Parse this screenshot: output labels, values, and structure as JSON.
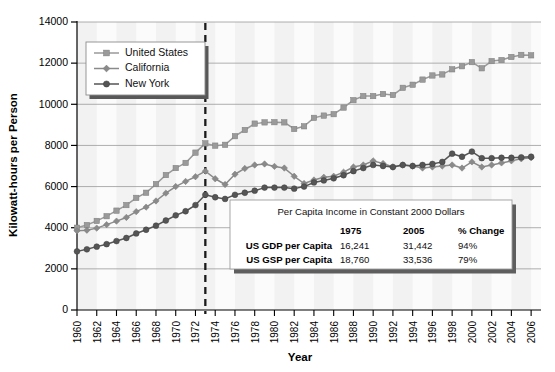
{
  "chart_data": {
    "type": "line",
    "title": "",
    "xlabel": "Year",
    "ylabel": "Kilowatt-hours per Person",
    "xlim": [
      1960,
      2007
    ],
    "ylim": [
      0,
      14000
    ],
    "grid": true,
    "legend_position": "top-left",
    "ytick_labels": [
      "0",
      "2000",
      "4000",
      "6000",
      "8000",
      "10000",
      "12000",
      "14000"
    ],
    "ytick_values": [
      0,
      2000,
      4000,
      6000,
      8000,
      10000,
      12000,
      14000
    ],
    "xtick_labels": [
      "1960",
      "1962",
      "1964",
      "1966",
      "1968",
      "1970",
      "1972",
      "1974",
      "1976",
      "1978",
      "1980",
      "1982",
      "1984",
      "1986",
      "1988",
      "1990",
      "1992",
      "1994",
      "1996",
      "1998",
      "2000",
      "2002",
      "2004",
      "2006"
    ],
    "xtick_values": [
      1960,
      1962,
      1964,
      1966,
      1968,
      1970,
      1972,
      1974,
      1976,
      1978,
      1980,
      1982,
      1984,
      1986,
      1988,
      1990,
      1992,
      1994,
      1996,
      1998,
      2000,
      2002,
      2004,
      2006
    ],
    "annotations": [
      {
        "type": "vertical-dashed-line",
        "x": 1973,
        "label": "1973"
      }
    ],
    "x": [
      1960,
      1961,
      1962,
      1963,
      1964,
      1965,
      1966,
      1967,
      1968,
      1969,
      1970,
      1971,
      1972,
      1973,
      1974,
      1975,
      1976,
      1977,
      1978,
      1979,
      1980,
      1981,
      1982,
      1983,
      1984,
      1985,
      1986,
      1987,
      1988,
      1989,
      1990,
      1991,
      1992,
      1993,
      1994,
      1995,
      1996,
      1997,
      1998,
      1999,
      2000,
      2001,
      2002,
      2003,
      2004,
      2005,
      2006
    ],
    "series": [
      {
        "name": "United States",
        "marker": "square",
        "color": "#9a9a9a",
        "values": [
          4000,
          4130,
          4330,
          4560,
          4830,
          5100,
          5450,
          5700,
          6120,
          6560,
          6900,
          7150,
          7650,
          8100,
          7990,
          8030,
          8450,
          8750,
          9060,
          9120,
          9130,
          9120,
          8800,
          8930,
          9340,
          9450,
          9520,
          9840,
          10200,
          10400,
          10400,
          10500,
          10450,
          10800,
          10950,
          11200,
          11400,
          11450,
          11700,
          11850,
          12050,
          11750,
          12100,
          12150,
          12300,
          12400,
          12380
        ]
      },
      {
        "name": "California",
        "marker": "diamond",
        "color": "#8a8a8a",
        "values": [
          3850,
          3880,
          3980,
          4150,
          4320,
          4500,
          4780,
          5000,
          5300,
          5680,
          6000,
          6250,
          6480,
          6750,
          6380,
          6100,
          6600,
          6880,
          7050,
          7100,
          6980,
          6900,
          6500,
          6150,
          6320,
          6450,
          6500,
          6700,
          6950,
          7050,
          7250,
          7120,
          6950,
          7050,
          7000,
          6900,
          6950,
          7000,
          7050,
          6900,
          7200,
          6950,
          7050,
          7150,
          7250,
          7350,
          7400
        ]
      },
      {
        "name": "New York",
        "marker": "circle",
        "color": "#555555",
        "values": [
          2850,
          2950,
          3080,
          3200,
          3350,
          3500,
          3720,
          3900,
          4100,
          4350,
          4600,
          4800,
          5100,
          5600,
          5480,
          5400,
          5600,
          5700,
          5800,
          5950,
          5950,
          5950,
          5900,
          6000,
          6200,
          6300,
          6400,
          6550,
          6750,
          6900,
          7050,
          7000,
          6950,
          7050,
          7000,
          7050,
          7100,
          7200,
          7600,
          7450,
          7700,
          7380,
          7380,
          7400,
          7400,
          7420,
          7450
        ]
      }
    ]
  },
  "table": {
    "title": "Per Capita Income in Constant 2000 Dollars",
    "columns": [
      "",
      "1975",
      "2005",
      "% Change"
    ],
    "rows": [
      {
        "label": "US GDP per Capita",
        "v1975": "16,241",
        "v2005": "31,442",
        "change": "94%"
      },
      {
        "label": "US GSP per Capita",
        "v1975": "18,760",
        "v2005": "33,536",
        "change": "79%"
      }
    ]
  }
}
